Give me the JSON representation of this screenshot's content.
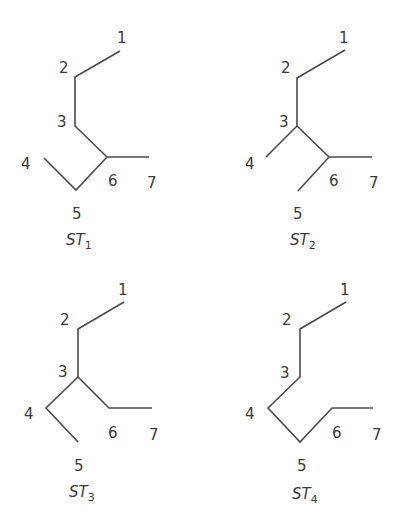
{
  "diagram": {
    "type": "skeletal-structures",
    "structures": [
      {
        "id": "ST1",
        "title_main": "ST",
        "title_sub": "1",
        "title_pos": [
          66,
          245
        ],
        "bonds": [
          [
            [
              120,
              51
            ],
            [
              75,
              77
            ],
            [
              75,
              126
            ],
            [
              107,
              157
            ],
            [
              149,
              157
            ]
          ],
          [
            [
              44,
              158
            ],
            [
              76,
              190
            ],
            [
              107,
              157
            ]
          ]
        ],
        "labels": [
          {
            "text": "1",
            "x": 117,
            "y": 43
          },
          {
            "text": "2",
            "x": 59,
            "y": 73
          },
          {
            "text": "3",
            "x": 57,
            "y": 127
          },
          {
            "text": "4",
            "x": 21,
            "y": 169
          },
          {
            "text": "5",
            "x": 72,
            "y": 219
          },
          {
            "text": "6",
            "x": 108,
            "y": 186
          },
          {
            "text": "7",
            "x": 147,
            "y": 188
          }
        ]
      },
      {
        "id": "ST2",
        "title_main": "ST",
        "title_sub": "2",
        "title_pos": [
          290,
          245
        ],
        "bonds": [
          [
            [
              345,
              50
            ],
            [
              297,
              78
            ],
            [
              297,
              126
            ],
            [
              329,
              157
            ],
            [
              372,
              157
            ]
          ],
          [
            [
              266,
              157
            ],
            [
              297,
              126
            ]
          ],
          [
            [
              298,
              191
            ],
            [
              329,
              157
            ]
          ]
        ],
        "labels": [
          {
            "text": "1",
            "x": 339,
            "y": 43
          },
          {
            "text": "2",
            "x": 281,
            "y": 73
          },
          {
            "text": "3",
            "x": 279,
            "y": 127
          },
          {
            "text": "4",
            "x": 245,
            "y": 169
          },
          {
            "text": "5",
            "x": 293,
            "y": 219
          },
          {
            "text": "6",
            "x": 329,
            "y": 186
          },
          {
            "text": "7",
            "x": 369,
            "y": 188
          }
        ]
      },
      {
        "id": "ST3",
        "title_main": "ST",
        "title_sub": "3",
        "title_pos": [
          69,
          497
        ],
        "bonds": [
          [
            [
              124,
              302
            ],
            [
              78,
              329
            ],
            [
              78,
              377
            ],
            [
              109,
              408
            ],
            [
              152,
              408
            ]
          ],
          [
            [
              78,
              442
            ],
            [
              46,
              408
            ],
            [
              78,
              377
            ]
          ]
        ],
        "labels": [
          {
            "text": "1",
            "x": 118,
            "y": 295
          },
          {
            "text": "2",
            "x": 60,
            "y": 325
          },
          {
            "text": "3",
            "x": 58,
            "y": 377
          },
          {
            "text": "4",
            "x": 24,
            "y": 419
          },
          {
            "text": "5",
            "x": 74,
            "y": 471
          },
          {
            "text": "6",
            "x": 108,
            "y": 438
          },
          {
            "text": "7",
            "x": 149,
            "y": 440
          }
        ]
      },
      {
        "id": "ST4",
        "title_main": "ST",
        "title_sub": "4",
        "title_pos": [
          292,
          499
        ],
        "bonds": [
          [
            [
              346,
              302
            ],
            [
              300,
              329
            ],
            [
              300,
              377
            ],
            [
              268,
              408
            ],
            [
              300,
              442
            ],
            [
              332,
              408
            ],
            [
              373,
              408
            ]
          ]
        ],
        "labels": [
          {
            "text": "1",
            "x": 340,
            "y": 295
          },
          {
            "text": "2",
            "x": 282,
            "y": 325
          },
          {
            "text": "3",
            "x": 280,
            "y": 378
          },
          {
            "text": "4",
            "x": 245,
            "y": 419
          },
          {
            "text": "5",
            "x": 297,
            "y": 471
          },
          {
            "text": "6",
            "x": 332,
            "y": 438
          },
          {
            "text": "7",
            "x": 372,
            "y": 440
          }
        ]
      }
    ]
  }
}
